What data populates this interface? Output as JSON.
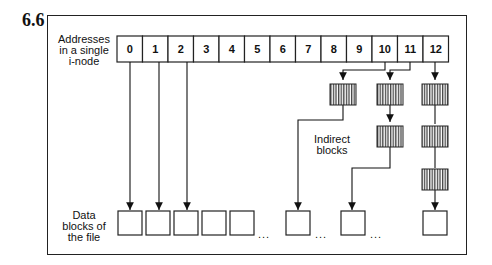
{
  "figure": {
    "number": "6.6",
    "inode_label": [
      "Addresses",
      "in a single",
      "i-node"
    ],
    "data_label": [
      "Data",
      "blocks of",
      "the file"
    ],
    "indirect_label": [
      "Indirect",
      "blocks"
    ],
    "ellipsis": "..."
  },
  "inode_addresses": [
    "0",
    "1",
    "2",
    "3",
    "4",
    "5",
    "6",
    "7",
    "8",
    "9",
    "10",
    "11",
    "12"
  ],
  "colors": {
    "line": "#222222",
    "background": "#ffffff",
    "hatch": "#444444"
  }
}
